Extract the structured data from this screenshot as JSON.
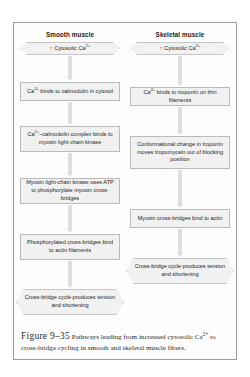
{
  "figure": {
    "number": "Figure 9–35",
    "caption": "Pathways leading from increased cytosolic Ca2+ to cross-bridge cycling in smooth and skeletal muscle fibers."
  },
  "columns": [
    {
      "id": "smooth",
      "title": "Smooth muscle",
      "nodes": [
        {
          "id": "smooth-start",
          "shape": "hex",
          "text": "↑ Cytosolic Ca2+"
        },
        {
          "id": "smooth-step-1",
          "shape": "rect",
          "text": "Ca2+ binds to calmodulin in cytosol"
        },
        {
          "id": "smooth-step-2",
          "shape": "rect",
          "text": "Ca2+–calmodulin complex binds to myosin light-chain kinase"
        },
        {
          "id": "smooth-step-3",
          "shape": "rect",
          "text": "Myosin light-chain kinase uses ATP to phosphorylate myosin cross-bridges"
        },
        {
          "id": "smooth-step-4",
          "shape": "rect",
          "text": "Phosphorylated cross-bridges bind to actin filaments"
        },
        {
          "id": "smooth-end",
          "shape": "hex",
          "text": "Cross-bridge cycle produces tension and shortening"
        }
      ]
    },
    {
      "id": "skeletal",
      "title": "Skeletal muscle",
      "nodes": [
        {
          "id": "skeletal-start",
          "shape": "hex",
          "text": "↑ Cytosolic Ca2+"
        },
        {
          "id": "skeletal-step-1",
          "shape": "rect",
          "text": "Ca2+ binds to troponin on thin filaments"
        },
        {
          "id": "skeletal-step-2",
          "shape": "rect",
          "text": "Conformational change in troponin moves tropomyosin out of blocking position"
        },
        {
          "id": "skeletal-step-3",
          "shape": "rect",
          "text": "Myosin cross-bridges bind to actin"
        },
        {
          "id": "skeletal-end",
          "shape": "hex",
          "text": "Cross-bridge cycle produces tension and shortening"
        }
      ]
    }
  ],
  "colors": {
    "node_fill": "#f1f1f1",
    "node_border": "#b9b9b9",
    "arrow": "#dedede",
    "frame_border": "#9b9b9b",
    "text": "#232323"
  }
}
